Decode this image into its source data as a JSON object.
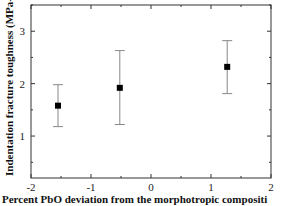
{
  "chart_data": {
    "type": "scatter",
    "title": "",
    "xlabel": "Percent PbO deviation from the morphotropic compositi",
    "ylabel": "Indentation fracture toughness (MPa-m",
    "ylabel_superscript": "1/2",
    "ylabel_suffix": ")",
    "xlim": [
      -2,
      2
    ],
    "ylim": [
      0.2,
      3.5
    ],
    "xticks": [
      -2,
      -1,
      0,
      1,
      2
    ],
    "xtick_labels": [
      "-2",
      "-1",
      "0",
      "1",
      "2"
    ],
    "yticks": [
      1,
      2,
      3
    ],
    "ytick_labels": [
      "1",
      "2",
      "3"
    ],
    "grid": false,
    "legend": null,
    "series": [
      {
        "name": "toughness",
        "marker": "square",
        "color": "#000000",
        "points": [
          {
            "x": -1.55,
            "y": 1.58,
            "y_low": 1.18,
            "y_high": 1.98
          },
          {
            "x": -0.52,
            "y": 1.92,
            "y_low": 1.22,
            "y_high": 2.63
          },
          {
            "x": 1.27,
            "y": 2.32,
            "y_low": 1.81,
            "y_high": 2.82
          }
        ]
      }
    ]
  }
}
